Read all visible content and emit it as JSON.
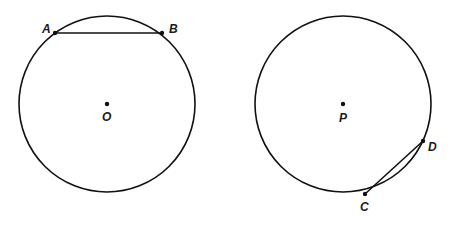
{
  "figures": [
    {
      "name": "circle-O",
      "center": {
        "label": "O",
        "x": 107,
        "y": 104
      },
      "radius": 88,
      "points": [
        {
          "label": "A",
          "x": 55,
          "y": 33,
          "label_x": 42,
          "label_y": 33
        },
        {
          "label": "B",
          "x": 162,
          "y": 33,
          "label_x": 169,
          "label_y": 33
        }
      ],
      "center_label_pos": {
        "x": 102,
        "y": 121
      },
      "segment": [
        "A",
        "B"
      ],
      "arc_highlight": false
    },
    {
      "name": "circle-P",
      "center": {
        "label": "P",
        "x": 343,
        "y": 104
      },
      "radius": 88,
      "points": [
        {
          "label": "D",
          "x": 423,
          "y": 141,
          "label_x": 428,
          "label_y": 151
        },
        {
          "label": "C",
          "x": 365,
          "y": 194,
          "label_x": 360,
          "label_y": 211
        }
      ],
      "center_label_pos": {
        "x": 339,
        "y": 122
      },
      "segment": [
        "C",
        "D"
      ],
      "arc_highlight": true
    }
  ],
  "colors": {
    "stroke": "#111111",
    "background": "#ffffff"
  }
}
